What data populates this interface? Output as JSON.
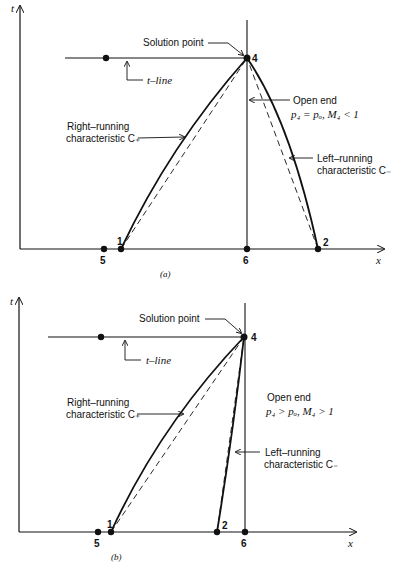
{
  "figure": {
    "panels": [
      {
        "id": "a",
        "caption": "(a)",
        "axis_labels": {
          "t": "t",
          "x": "x"
        },
        "points": {
          "p1": "1",
          "p2": "2",
          "p4": "4",
          "p5": "5",
          "p6": "6"
        },
        "labels": {
          "solution_point": "Solution point",
          "t_line": "t–line",
          "open_end_title": "Open end",
          "open_end_condition": "p₄ = pₒ, M₄ < 1",
          "right_running_1": "Right–running",
          "right_running_2": "characteristic C₊",
          "left_running_1": "Left–running",
          "left_running_2": "characteristic C₋"
        }
      },
      {
        "id": "b",
        "caption": "(b)",
        "axis_labels": {
          "t": "t",
          "x": "x"
        },
        "points": {
          "p1": "1",
          "p2": "2",
          "p4": "4",
          "p5": "5",
          "p6": "6"
        },
        "labels": {
          "solution_point": "Solution point",
          "t_line": "t–line",
          "open_end_title": "Open end",
          "open_end_condition": "p₄ > pₒ, M₄ > 1",
          "right_running_1": "Right–running",
          "right_running_2": "characteristic C₊",
          "left_running_1": "Left–running",
          "left_running_2": "characteristic C₋"
        }
      }
    ]
  }
}
